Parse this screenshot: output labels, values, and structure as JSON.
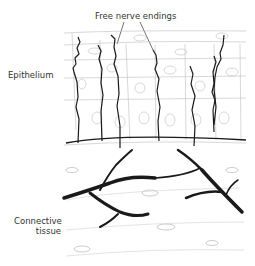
{
  "diagram": {
    "title": "Free nerve endings",
    "labels": {
      "epithelium": "Epithelium",
      "connective_line1": "Connective",
      "connective_line2": "tissue"
    },
    "colors": {
      "nerve": "#1a1a1a",
      "cell_outline": "#b8b8b8",
      "background": "#ffffff"
    }
  }
}
